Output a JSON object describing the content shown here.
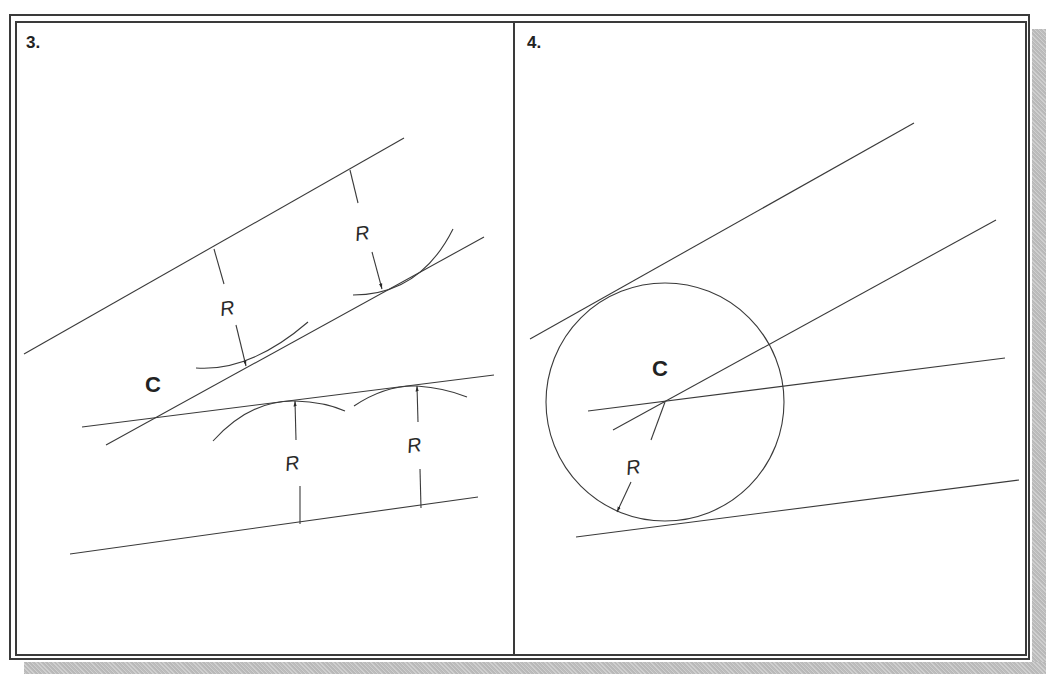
{
  "panels": [
    {
      "label": "3.",
      "center_label": "C",
      "radius_label": "R",
      "description": "Offset lines at distance R from each given line; arcs of radius R locate offset lines; their intersection gives center C"
    },
    {
      "label": "4.",
      "center_label": "C",
      "radius_label": "R",
      "description": "Circle of radius R drawn from center C, tangent to both given lines"
    }
  ],
  "colors": {
    "line": "#3a3a3a",
    "frame": "#3a3a3a",
    "shadow": "#c4c4c4",
    "background": "#ffffff"
  }
}
